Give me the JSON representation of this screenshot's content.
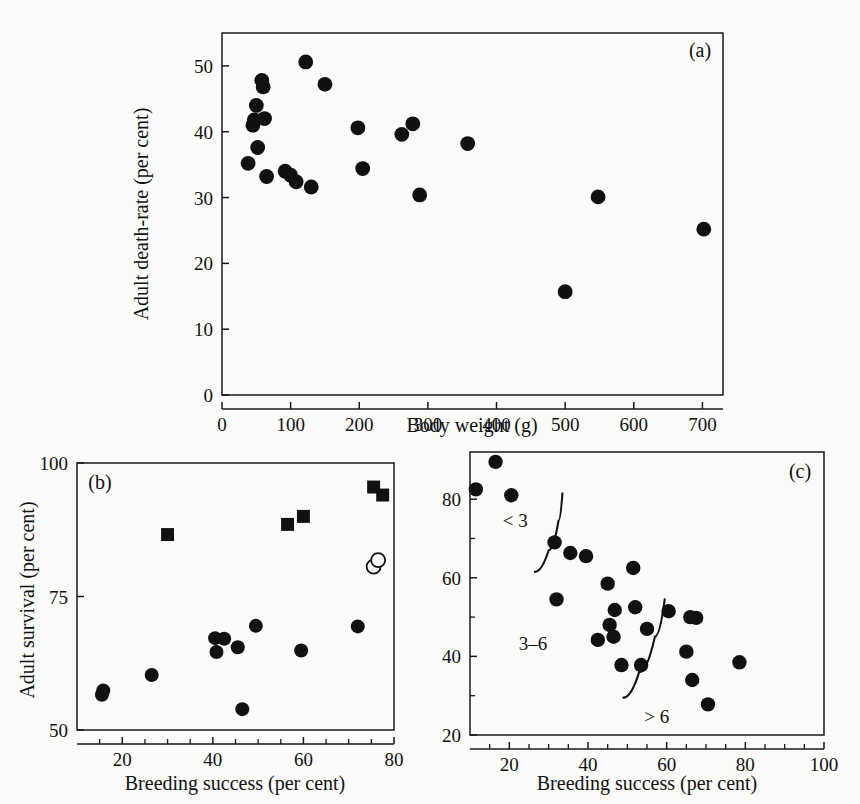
{
  "figure": {
    "background": "#fbfbf9",
    "marker_color": "#111111"
  },
  "chart_data": [
    {
      "id": "panel-a",
      "type": "scatter",
      "panel_label": "(a)",
      "title": "",
      "xlabel": "Body weight (g)",
      "ylabel": "Adult death-rate (per cent)",
      "xlim": [
        0,
        730
      ],
      "ylim": [
        0,
        55
      ],
      "xticks": [
        0,
        100,
        200,
        300,
        400,
        500,
        600,
        700
      ],
      "yticks": [
        0,
        10,
        20,
        30,
        40,
        50
      ],
      "grid": false,
      "legend": "none",
      "series": [
        {
          "name": "species",
          "marker": "filled-circle",
          "points": [
            [
              38,
              35.2
            ],
            [
              45,
              41.0
            ],
            [
              47,
              41.8
            ],
            [
              50,
              44.0
            ],
            [
              52,
              37.6
            ],
            [
              58,
              47.8
            ],
            [
              60,
              46.8
            ],
            [
              62,
              42.0
            ],
            [
              65,
              33.2
            ],
            [
              92,
              34.0
            ],
            [
              100,
              33.4
            ],
            [
              108,
              32.4
            ],
            [
              122,
              50.6
            ],
            [
              130,
              31.6
            ],
            [
              150,
              47.2
            ],
            [
              198,
              40.6
            ],
            [
              205,
              34.4
            ],
            [
              262,
              39.6
            ],
            [
              278,
              41.2
            ],
            [
              288,
              30.4
            ],
            [
              358,
              38.2
            ],
            [
              500,
              15.7
            ],
            [
              548,
              30.1
            ],
            [
              702,
              25.2
            ]
          ]
        }
      ]
    },
    {
      "id": "panel-b",
      "type": "scatter",
      "panel_label": "(b)",
      "title": "",
      "xlabel": "Breeding success (per cent)",
      "ylabel": "Adult survival (per cent)",
      "xlim": [
        10,
        80
      ],
      "ylim": [
        50,
        100
      ],
      "xticks": [
        20,
        40,
        60,
        80
      ],
      "xticks_minor": [
        15,
        25,
        30,
        35,
        45,
        50,
        55,
        65,
        70,
        75
      ],
      "yticks": [
        50,
        75,
        100
      ],
      "grid": false,
      "legend": "none",
      "series": [
        {
          "name": "filled circles",
          "marker": "filled-circle",
          "points": [
            [
              15.5,
              56.6
            ],
            [
              15.8,
              57.4
            ],
            [
              26.5,
              60.3
            ],
            [
              40.5,
              67.2
            ],
            [
              40.8,
              64.6
            ],
            [
              42.5,
              67.1
            ],
            [
              45.5,
              65.5
            ],
            [
              46.5,
              53.9
            ],
            [
              49.5,
              69.5
            ],
            [
              59.5,
              64.9
            ],
            [
              72.0,
              69.4
            ]
          ]
        },
        {
          "name": "filled squares",
          "marker": "filled-square",
          "points": [
            [
              30.0,
              86.6
            ],
            [
              56.5,
              88.5
            ],
            [
              60.0,
              90.0
            ],
            [
              75.5,
              95.5
            ],
            [
              77.5,
              94.0
            ]
          ]
        },
        {
          "name": "open circles",
          "marker": "open-circle",
          "points": [
            [
              75.5,
              80.6
            ],
            [
              76.5,
              81.8
            ]
          ]
        }
      ]
    },
    {
      "id": "panel-c",
      "type": "scatter",
      "panel_label": "(c)",
      "title": "",
      "xlabel": "Breeding success (per cent)",
      "ylabel": "",
      "xlim": [
        10,
        100
      ],
      "ylim": [
        20,
        92
      ],
      "xticks": [
        20,
        40,
        60,
        80,
        100
      ],
      "xticks_minor": [
        15,
        25,
        30,
        35,
        45,
        50,
        55,
        65,
        70,
        75,
        85,
        90,
        95
      ],
      "yticks": [
        20,
        40,
        60,
        80
      ],
      "yticks_minor": [
        30,
        50,
        70
      ],
      "grid": false,
      "legend": "none",
      "annotations": [
        {
          "text": "< 3",
          "x": 21.5,
          "y": 73.0
        },
        {
          "text": "3–6",
          "x": 26.0,
          "y": 41.5
        },
        {
          "text": "> 6",
          "x": 57.5,
          "y": 23.0
        }
      ],
      "dividers": [
        {
          "name": "divider-less-than-3",
          "points": [
            [
              26.5,
              61.5
            ],
            [
              30.0,
              67.0
            ],
            [
              32.5,
              74.5
            ],
            [
              33.5,
              81.5
            ]
          ]
        },
        {
          "name": "divider-greater-than-6",
          "points": [
            [
              49.0,
              29.5
            ],
            [
              53.0,
              36.0
            ],
            [
              57.0,
              45.0
            ],
            [
              59.5,
              54.5
            ]
          ]
        }
      ],
      "series": [
        {
          "name": "colonies",
          "marker": "filled-circle",
          "points": [
            [
              11.5,
              82.5
            ],
            [
              16.5,
              89.5
            ],
            [
              20.5,
              81.0
            ],
            [
              31.5,
              69.0
            ],
            [
              32.0,
              54.5
            ],
            [
              35.5,
              66.3
            ],
            [
              39.5,
              65.5
            ],
            [
              42.5,
              44.2
            ],
            [
              45.0,
              58.5
            ],
            [
              45.5,
              48.0
            ],
            [
              46.5,
              45.0
            ],
            [
              46.8,
              51.8
            ],
            [
              48.5,
              37.8
            ],
            [
              51.5,
              62.5
            ],
            [
              52.0,
              52.5
            ],
            [
              53.5,
              37.8
            ],
            [
              55.0,
              47.0
            ],
            [
              60.5,
              51.5
            ],
            [
              66.0,
              50.0
            ],
            [
              67.5,
              49.8
            ],
            [
              65.0,
              41.2
            ],
            [
              66.5,
              34.0
            ],
            [
              70.5,
              27.8
            ],
            [
              78.5,
              38.5
            ]
          ]
        }
      ]
    }
  ]
}
